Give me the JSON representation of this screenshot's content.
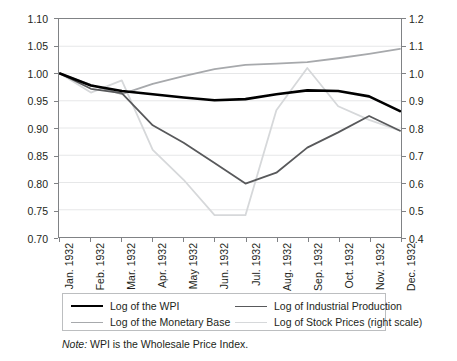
{
  "chart_data": {
    "type": "line",
    "title": "",
    "subtitle": "",
    "xlabel": "",
    "ylabel": "",
    "y2label": "",
    "grid": true,
    "legend_position": "bottom",
    "ylim": [
      0.7,
      1.1
    ],
    "y2lim": [
      0.4,
      1.2
    ],
    "yticks": [
      "1.10",
      "1.05",
      "1.00",
      "0.95",
      "0.90",
      "0.85",
      "0.80",
      "0.75",
      "0.70"
    ],
    "ytick_values": [
      1.1,
      1.05,
      1.0,
      0.95,
      0.9,
      0.85,
      0.8,
      0.75,
      0.7
    ],
    "y2ticks": [
      "1.2",
      "1.1",
      "1.0",
      "0.9",
      "0.8",
      "0.7",
      "0.6",
      "0.5",
      "0.4"
    ],
    "y2tick_values": [
      1.2,
      1.1,
      1.0,
      0.9,
      0.8,
      0.7,
      0.6,
      0.5,
      0.4
    ],
    "categories": [
      "Jan. 1932",
      "Feb. 1932",
      "Mar. 1932",
      "Apr. 1932",
      "May 1932",
      "Jun. 1932",
      "Jul. 1932",
      "Aug. 1932",
      "Sep. 1932",
      "Oct. 1932",
      "Nov. 1932",
      "Dec. 1932"
    ],
    "series": [
      {
        "name": "Log of the WPI",
        "axis": "left",
        "color": "#000000",
        "width": 2.6,
        "values": [
          1.0,
          0.978,
          0.968,
          0.962,
          0.956,
          0.951,
          0.953,
          0.962,
          0.969,
          0.968,
          0.958,
          0.931
        ]
      },
      {
        "name": "Log of Industrial Production",
        "axis": "left",
        "color": "#58595b",
        "width": 1.8,
        "values": [
          1.0,
          0.972,
          0.964,
          0.905,
          0.873,
          0.836,
          0.798,
          0.818,
          0.864,
          0.892,
          0.922,
          0.895
        ]
      },
      {
        "name": "Log of the Monetary Base",
        "axis": "left",
        "color": "#a7a9ac",
        "width": 1.8,
        "values": [
          1.0,
          0.979,
          0.962,
          0.981,
          0.995,
          1.008,
          1.016,
          1.018,
          1.021,
          1.028,
          1.036,
          1.045
        ]
      },
      {
        "name": "Log of Stock Prices (right scale)",
        "axis": "right",
        "color": "#d6d8da",
        "width": 1.8,
        "values": [
          1.0,
          0.93,
          0.975,
          0.72,
          0.61,
          0.48,
          0.48,
          0.865,
          1.02,
          0.88,
          0.83,
          0.79
        ]
      }
    ],
    "legend": [
      {
        "label": "Log of the WPI",
        "color": "#000000",
        "width": 2.6
      },
      {
        "label": "Log of Industrial Production",
        "color": "#58595b",
        "width": 1.8
      },
      {
        "label": "Log of the Monetary Base",
        "color": "#a7a9ac",
        "width": 1.8
      },
      {
        "label": "Log of Stock Prices (right scale)",
        "color": "#d6d8da",
        "width": 1.8
      }
    ],
    "note": {
      "keyword": "Note:",
      "text": " WPI is the Wholesale Price Index."
    },
    "colors": {
      "wpi": "#000000",
      "industrial_production": "#58595b",
      "monetary_base": "#a7a9ac",
      "stock_prices": "#d6d8da",
      "axis": "#808285",
      "gridline": "#e6e7e8",
      "text": "#231f20"
    }
  }
}
